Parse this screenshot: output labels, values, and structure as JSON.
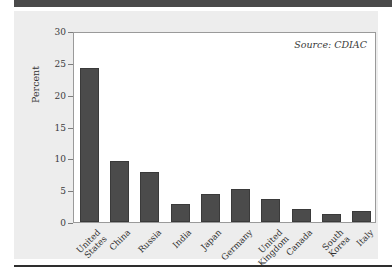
{
  "figure": {
    "annotation": "Source: CDIAC",
    "panel_bg": "#ededed",
    "plot_bg": "#ffffff",
    "bar_color": "#4b4b4b",
    "axis_color": "#7d7d7d",
    "rule_color": "#4a4a4a"
  },
  "chart_data": {
    "type": "bar",
    "title": "",
    "xlabel": "",
    "ylabel": "Percent",
    "ylim": [
      0,
      30
    ],
    "yticks": [
      0,
      5,
      10,
      15,
      20,
      25,
      30
    ],
    "ytick_labels": [
      "0",
      "5",
      "10",
      "15",
      "20",
      "25",
      "30"
    ],
    "grid": false,
    "legend": null,
    "annotations": [
      "Source: CDIAC"
    ],
    "categories": [
      "United States",
      "China",
      "Russia",
      "India",
      "Japan",
      "Germany",
      "United Kingdom",
      "Canada",
      "South Korea",
      "Italy"
    ],
    "category_lines": [
      "United\nStates",
      "China",
      "Russia",
      "India",
      "Japan",
      "Germany",
      "United\nKingdom",
      "Canada",
      "South\nKorea",
      "Italy"
    ],
    "values": [
      24.5,
      9.7,
      8.0,
      2.8,
      4.5,
      5.2,
      3.6,
      2.1,
      1.2,
      1.8
    ]
  }
}
